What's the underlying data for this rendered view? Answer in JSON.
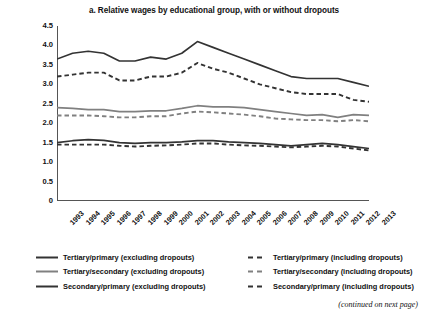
{
  "chart_data": {
    "type": "line",
    "title": "a. Relative wages by educational group, with or without dropouts",
    "xlabel": "",
    "ylabel": "Wage ratio",
    "ylim": [
      0,
      4.5
    ],
    "ytick_step": 0.5,
    "grid": false,
    "legend_position": "bottom",
    "x": [
      1993,
      1994,
      1995,
      1996,
      1997,
      1998,
      1999,
      2000,
      2001,
      2002,
      2003,
      2004,
      2005,
      2006,
      2007,
      2008,
      2009,
      2010,
      2011,
      2012,
      2013
    ],
    "categories": [
      "1993",
      "1994",
      "1995",
      "1996",
      "1997",
      "1998",
      "1999",
      "2000",
      "2001",
      "2002",
      "2003",
      "2004",
      "2005",
      "2006",
      "2007",
      "2008",
      "2009",
      "2010",
      "2011",
      "2012",
      "2013"
    ],
    "series": [
      {
        "name": "Tertiary/primary (excluding dropouts)",
        "style": "solid",
        "color": "#333333",
        "values": [
          3.65,
          3.8,
          3.85,
          3.8,
          3.6,
          3.6,
          3.7,
          3.65,
          3.8,
          4.1,
          3.95,
          3.8,
          3.65,
          3.5,
          3.35,
          3.2,
          3.15,
          3.15,
          3.15,
          3.05,
          2.95
        ]
      },
      {
        "name": "Tertiary/primary (including dropouts)",
        "style": "dashed",
        "color": "#333333",
        "values": [
          3.2,
          3.25,
          3.3,
          3.3,
          3.1,
          3.1,
          3.2,
          3.2,
          3.3,
          3.55,
          3.4,
          3.3,
          3.15,
          3.0,
          2.9,
          2.8,
          2.75,
          2.75,
          2.75,
          2.6,
          2.55
        ]
      },
      {
        "name": "Tertiary/secondary (excluding dropouts)",
        "style": "solid",
        "color": "#808080",
        "values": [
          2.4,
          2.38,
          2.35,
          2.35,
          2.3,
          2.3,
          2.32,
          2.32,
          2.38,
          2.45,
          2.42,
          2.42,
          2.4,
          2.35,
          2.3,
          2.25,
          2.2,
          2.22,
          2.15,
          2.22,
          2.2
        ]
      },
      {
        "name": "Tertiary/secondary (including dropouts)",
        "style": "dashed",
        "color": "#808080",
        "values": [
          2.2,
          2.2,
          2.2,
          2.18,
          2.15,
          2.15,
          2.18,
          2.18,
          2.25,
          2.3,
          2.28,
          2.25,
          2.22,
          2.18,
          2.12,
          2.1,
          2.08,
          2.08,
          2.05,
          2.08,
          2.05
        ]
      },
      {
        "name": "Secondary/primary (excluding dropouts)",
        "style": "solid",
        "color": "#333333",
        "values": [
          1.5,
          1.55,
          1.58,
          1.56,
          1.5,
          1.48,
          1.5,
          1.5,
          1.52,
          1.55,
          1.55,
          1.52,
          1.5,
          1.48,
          1.45,
          1.42,
          1.45,
          1.48,
          1.45,
          1.4,
          1.35
        ]
      },
      {
        "name": "Secondary/primary (including dropouts)",
        "style": "dashed",
        "color": "#333333",
        "values": [
          1.45,
          1.45,
          1.45,
          1.45,
          1.42,
          1.4,
          1.42,
          1.43,
          1.45,
          1.48,
          1.48,
          1.45,
          1.43,
          1.42,
          1.4,
          1.38,
          1.4,
          1.42,
          1.4,
          1.35,
          1.3
        ]
      }
    ],
    "yticks": [
      "4.5",
      "4.0",
      "3.5",
      "3.0",
      "2.5",
      "2.0",
      "1.5",
      "1.0",
      "0.5",
      "0"
    ]
  },
  "legend": {
    "rows": [
      {
        "left": {
          "label": "Tertiary/primary (excluding dropouts)",
          "style": "solid",
          "color": "#333333"
        },
        "right": {
          "label": "Tertiary/primary (including dropouts)",
          "style": "dashed",
          "color": "#333333"
        }
      },
      {
        "left": {
          "label": "Tertiary/secondary (excluding dropouts)",
          "style": "solid",
          "color": "#808080"
        },
        "right": {
          "label": "Tertiary/secondary (including dropouts)",
          "style": "dashed",
          "color": "#808080"
        }
      },
      {
        "left": {
          "label": "Secondary/primary (excluding dropouts)",
          "style": "solid",
          "color": "#333333"
        },
        "right": {
          "label": "Secondary/primary (including dropouts)",
          "style": "dashed",
          "color": "#333333"
        }
      }
    ]
  },
  "footnote": "(continued on next page)"
}
